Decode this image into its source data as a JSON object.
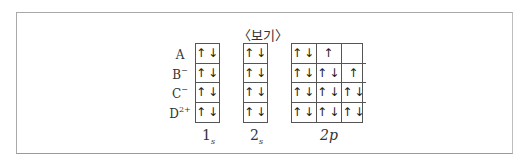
{
  "title": "〈보기〉",
  "rows": [
    {
      "label": "A",
      "charge": ""
    },
    {
      "label": "B",
      "charge": "−"
    },
    {
      "label": "C",
      "charge": "−"
    },
    {
      "label": "D",
      "charge": "2+"
    }
  ],
  "orbitals": [
    {
      "name": "1",
      "sub": "s",
      "cells_per_row": 1,
      "rows": [
        [
          "↑↓"
        ],
        [
          "↑↓"
        ],
        [
          "↑↓"
        ],
        [
          "↑↓"
        ]
      ]
    },
    {
      "name": "2",
      "sub": "s",
      "cells_per_row": 1,
      "rows": [
        [
          "↑↓"
        ],
        [
          "↑↓"
        ],
        [
          "↑↓"
        ],
        [
          "↑↓"
        ]
      ]
    },
    {
      "name": "2p",
      "sub": "",
      "cells_per_row": 3,
      "rows": [
        [
          "↑↓",
          "↑",
          ""
        ],
        [
          "↑↓",
          "↑↓",
          "↑"
        ],
        [
          "↑↓",
          "↑↓",
          "↑↓"
        ],
        [
          "↑↓",
          "↑↓",
          "↑↓"
        ]
      ]
    }
  ]
}
